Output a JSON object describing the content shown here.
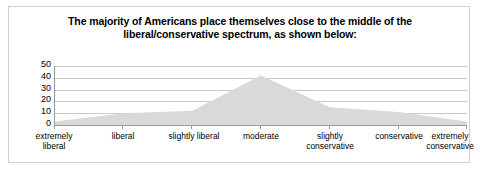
{
  "chart_data": {
    "type": "area",
    "title": "The majority of Americans place themselves close to the middle of the liberal/conservative spectrum, as shown below:",
    "title_lines": [
      "The majority of Americans place themselves close to the middle of the",
      "liberal/conservative spectrum, as shown below:"
    ],
    "categories": [
      "extremely liberal",
      "liberal",
      "slightly liberal",
      "moderate",
      "slightly conservative",
      "conservative",
      "extremely conservative"
    ],
    "category_lines": [
      [
        "extremely",
        "liberal"
      ],
      [
        "liberal"
      ],
      [
        "slightly liberal"
      ],
      [
        "moderate"
      ],
      [
        "slightly",
        "conservative"
      ],
      [
        "conservative"
      ],
      [
        "extremely",
        "conservative"
      ]
    ],
    "values": [
      3,
      10,
      12,
      42,
      15,
      11,
      3
    ],
    "xlabel": "",
    "ylabel": "",
    "ylim": [
      0,
      50
    ],
    "yticks": [
      0,
      10,
      20,
      30,
      40,
      50
    ],
    "ytick_labels": [
      "0",
      "10",
      "20",
      "30",
      "40",
      "50"
    ],
    "grid": true,
    "legend": false,
    "series_fill_color": "#d9d9d9",
    "gridline_color": "#c8c8c8",
    "axis_color": "#9a9a9a",
    "frame_border_color": "#d0d0d0"
  }
}
